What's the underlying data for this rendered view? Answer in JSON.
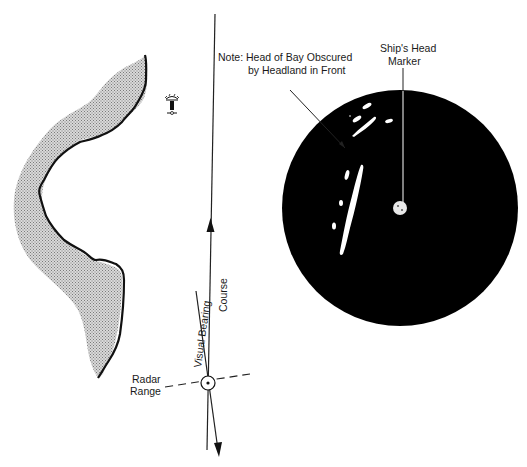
{
  "diagram": {
    "colors": {
      "land_fill": "#c8c8c8",
      "coast_line": "#111111",
      "radar_screen": "#000000",
      "radar_echo": "#ffffff",
      "line": "#222222"
    },
    "labels": {
      "note_line1": "Note: Head of Bay Obscured",
      "note_line2": "by Headland in Front",
      "ships_head_line1": "Ship's Head",
      "ships_head_line2": "Marker",
      "course": "Course",
      "visual_bearing": "Visual Bearing",
      "radar_line1": "Radar",
      "radar_line2": "Range"
    },
    "icons": {
      "lighthouse": "lighthouse-symbol",
      "ship_position": "circled-dot-fix",
      "course_arrow": "arrowhead-up",
      "bearing_arrow": "arrowhead-down"
    },
    "radar_display": {
      "center": [
        400,
        208
      ],
      "radius": 118,
      "echoes": [
        "headland-echo-long",
        "islet-echoes",
        "own-ship-center-blob"
      ]
    }
  }
}
